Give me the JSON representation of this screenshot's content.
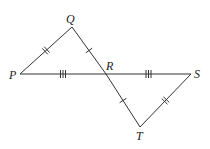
{
  "diagram": {
    "points": {
      "P": {
        "label": "P"
      },
      "Q": {
        "label": "Q"
      },
      "R": {
        "label": "R"
      },
      "S": {
        "label": "S"
      },
      "T": {
        "label": "T"
      }
    },
    "segments": [
      {
        "from": "P",
        "to": "Q",
        "ticks": 2
      },
      {
        "from": "Q",
        "to": "R",
        "ticks": 1
      },
      {
        "from": "P",
        "to": "R",
        "ticks": 3
      },
      {
        "from": "R",
        "to": "S",
        "ticks": 3
      },
      {
        "from": "R",
        "to": "T",
        "ticks": 1
      },
      {
        "from": "T",
        "to": "S",
        "ticks": 2
      }
    ]
  }
}
